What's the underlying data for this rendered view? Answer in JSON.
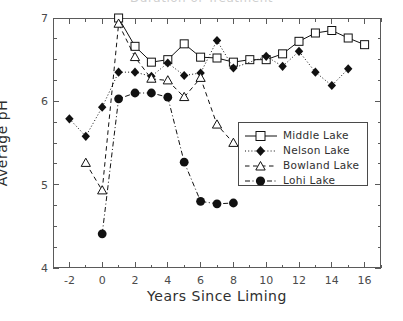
{
  "chart_data": {
    "type": "line",
    "title": "Duration of Treatment",
    "xlabel": "Years Since Liming",
    "ylabel": "Average pH",
    "xlim": [
      -3,
      17
    ],
    "ylim": [
      4,
      7
    ],
    "xticks": [
      -2,
      0,
      2,
      4,
      6,
      8,
      10,
      12,
      14,
      16
    ],
    "yticks": [
      4,
      5,
      6,
      7
    ],
    "xminor_step": 1,
    "yminor_step": 0.25,
    "grid": false,
    "legend_position": "center-right",
    "series": [
      {
        "name": "Middle Lake",
        "marker": "open-square",
        "line": "solid",
        "color": "#111111",
        "points": [
          {
            "x": 1,
            "y": 7.0
          },
          {
            "x": 2,
            "y": 6.66
          },
          {
            "x": 3,
            "y": 6.47
          },
          {
            "x": 4,
            "y": 6.5
          },
          {
            "x": 5,
            "y": 6.69
          },
          {
            "x": 6,
            "y": 6.53
          },
          {
            "x": 7,
            "y": 6.52
          },
          {
            "x": 8,
            "y": 6.47
          },
          {
            "x": 9,
            "y": 6.5
          },
          {
            "x": 10,
            "y": 6.5
          },
          {
            "x": 11,
            "y": 6.57
          },
          {
            "x": 12,
            "y": 6.72
          },
          {
            "x": 13,
            "y": 6.82
          },
          {
            "x": 14,
            "y": 6.85
          },
          {
            "x": 15,
            "y": 6.76
          },
          {
            "x": 16,
            "y": 6.68
          }
        ]
      },
      {
        "name": "Nelson Lake",
        "marker": "filled-diamond",
        "line": "dotted",
        "color": "#111111",
        "points": [
          {
            "x": -2,
            "y": 5.79
          },
          {
            "x": -1,
            "y": 5.58
          },
          {
            "x": 0,
            "y": 5.93
          },
          {
            "x": 1,
            "y": 6.35
          },
          {
            "x": 2,
            "y": 6.35
          },
          {
            "x": 3,
            "y": 6.3
          },
          {
            "x": 4,
            "y": 6.46
          },
          {
            "x": 5,
            "y": 6.31
          },
          {
            "x": 6,
            "y": 6.34
          },
          {
            "x": 7,
            "y": 6.73
          },
          {
            "x": 8,
            "y": 6.4
          },
          {
            "x": 10,
            "y": 6.54
          },
          {
            "x": 11,
            "y": 6.42
          },
          {
            "x": 12,
            "y": 6.6
          },
          {
            "x": 13,
            "y": 6.35
          },
          {
            "x": 14,
            "y": 6.19
          },
          {
            "x": 15,
            "y": 6.39
          }
        ]
      },
      {
        "name": "Bowland Lake",
        "marker": "open-triangle",
        "line": "dashed",
        "color": "#111111",
        "points": [
          {
            "x": -1,
            "y": 5.26
          },
          {
            "x": 0,
            "y": 4.93
          },
          {
            "x": 1,
            "y": 6.93
          },
          {
            "x": 2,
            "y": 6.53
          },
          {
            "x": 3,
            "y": 6.27
          },
          {
            "x": 4,
            "y": 6.25
          },
          {
            "x": 5,
            "y": 6.05
          },
          {
            "x": 6,
            "y": 6.28
          },
          {
            "x": 7,
            "y": 5.72
          },
          {
            "x": 8,
            "y": 5.5
          }
        ]
      },
      {
        "name": "Lohi Lake",
        "marker": "filled-circle",
        "line": "dash-dot",
        "color": "#111111",
        "points": [
          {
            "x": 0,
            "y": 4.41
          },
          {
            "x": 1,
            "y": 6.03
          },
          {
            "x": 2,
            "y": 6.1
          },
          {
            "x": 3,
            "y": 6.1
          },
          {
            "x": 4,
            "y": 6.05
          },
          {
            "x": 5,
            "y": 5.27
          },
          {
            "x": 6,
            "y": 4.8
          },
          {
            "x": 7,
            "y": 4.77
          },
          {
            "x": 8,
            "y": 4.78
          }
        ]
      }
    ]
  }
}
